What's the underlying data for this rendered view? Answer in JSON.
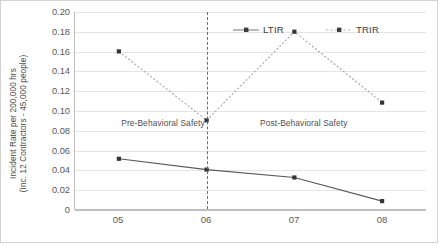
{
  "chart_data": {
    "type": "line",
    "title": "",
    "xlabel": "",
    "ylabel": "Incident Rate per 200,000 hrs",
    "ylabel_line2": "(Inc. 12 Contractors - 45,000 people)",
    "categories": [
      "05",
      "06",
      "07",
      "08"
    ],
    "series": [
      {
        "name": "LTIR",
        "values": [
          0.051,
          0.04,
          0.032,
          0.008
        ],
        "style": "solid",
        "color": "#595959"
      },
      {
        "name": "TRIR",
        "values": [
          0.16,
          0.09,
          0.18,
          0.108
        ],
        "style": "dotted",
        "color": "#a6a6a6"
      }
    ],
    "ylim": [
      0,
      0.2
    ],
    "ytick_labels": [
      "0.20",
      "0.18",
      "0.16",
      "0.14",
      "0.12",
      "0.10",
      "0.08",
      "0.06",
      "0.04",
      "0.02",
      "0"
    ],
    "ytick_values": [
      0.2,
      0.18,
      0.16,
      0.14,
      0.12,
      0.1,
      0.08,
      0.06,
      0.04,
      0.02,
      0
    ],
    "grid": true,
    "legend_position": "top-inside",
    "annotations": [
      {
        "text": "Pre-Behavioral Safety",
        "x": 0.5,
        "y": 0.088
      },
      {
        "text": "Post-Behavioral Safety",
        "x": 2.1,
        "y": 0.088
      }
    ],
    "reference_line": {
      "at_category": "06",
      "style": "dashed",
      "color": "#6d6d6d"
    }
  },
  "legend": {
    "items": [
      {
        "label": "LTIR"
      },
      {
        "label": "TRIR"
      }
    ]
  }
}
